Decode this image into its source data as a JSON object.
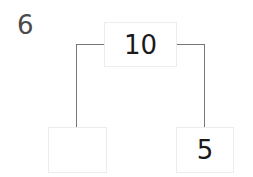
{
  "question": {
    "number": "6"
  },
  "number_bond": {
    "whole": "10",
    "parts": [
      {
        "value": ""
      },
      {
        "value": "5"
      }
    ]
  },
  "colors": {
    "line": "#777777",
    "box_border": "#ececec",
    "text": "#1a1a1a"
  }
}
